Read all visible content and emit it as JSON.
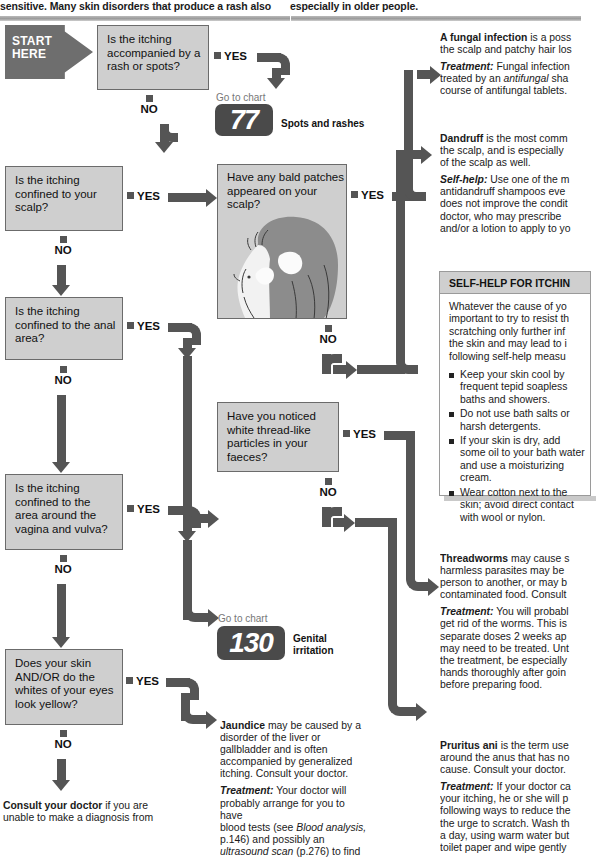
{
  "page": {
    "top_text_left": "sensitive. Many skin disorders that produce a rash also",
    "top_text_right": "especially in older people."
  },
  "start": {
    "line1": "START",
    "line2": "HERE"
  },
  "answers": {
    "yes": "YES",
    "no": "NO"
  },
  "questions": [
    {
      "id": "q-rash",
      "text": "Is the itching accompanied by a rash or spots?"
    },
    {
      "id": "q-scalp",
      "text": "Is the itching confined to your scalp?"
    },
    {
      "id": "q-anal",
      "text": "Is the itching confined to the anal area?"
    },
    {
      "id": "q-vagina",
      "text": "Is the itching confined to the area around the vagina and vulva?"
    },
    {
      "id": "q-yellow",
      "text": "Does your skin AND/OR do the whites of your eyes look yellow?"
    },
    {
      "id": "q-bald",
      "text": "Have any bald patches appeared on your scalp?"
    },
    {
      "id": "q-threadlike",
      "text": "Have you noticed white thread-like particles in your faeces?"
    }
  ],
  "goto": {
    "label": "Go to chart",
    "charts": [
      {
        "number": "77",
        "title": "Spots and rashes"
      },
      {
        "number": "130",
        "title": "Genital irritation"
      }
    ]
  },
  "advice": {
    "fungal": {
      "lead": "A fungal infection",
      "body": " is a poss",
      "line2": "the scalp and patchy hair los",
      "tx_label": "Treatment:",
      "tx_body": " Fungal infection",
      "tx_line2_a": "treated by an ",
      "tx_line2_i": "antifungal",
      "tx_line2_b": " sha",
      "tx_line3": "course of antifungal tablets."
    },
    "dandruff": {
      "lead": "Dandruff",
      "body": " is the most comm",
      "line2": "the scalp, and is especially",
      "line3": "of the scalp as well.",
      "sh_label": "Self-help:",
      "sh_body": " Use one of the m",
      "sh_line2": "antidandruff shampoos eve",
      "sh_line3": "does not improve the condit",
      "sh_line4": "doctor, who may prescribe",
      "sh_line5": "and/or a lotion to apply to yo"
    },
    "threadworms": {
      "lead": "Threadworms",
      "body": " may cause s",
      "line2": "harmless parasites may be",
      "line3": "person to another, or may b",
      "line4": "contaminated food. Consult",
      "tx_label": "Treatment:",
      "tx_body": " You will probabl",
      "tx_line2": "get rid of the worms. This is",
      "tx_line3": "separate doses 2 weeks ap",
      "tx_line4": "may need to be treated. Unt",
      "tx_line5": "the treatment, be especially",
      "tx_line6": "hands thoroughly after goin",
      "tx_line7": "before preparing food."
    },
    "jaundice": {
      "lead": "Jaundice",
      "body": " may be caused by a",
      "line2": "disorder of the liver or",
      "line3": "gallbladder and is often",
      "line4": "accompanied by generalized",
      "line5": "itching. Consult your doctor.",
      "tx_label": "Treatment:",
      "tx_body": " Your doctor will",
      "tx_line2": "probably arrange for you to have",
      "tx_line3_a": "blood tests (see ",
      "tx_line3_i": "Blood analysis,",
      "tx_line4": "p.146) and possibly an",
      "tx_line5_i": "ultrasound scan",
      "tx_line5_b": " (p.276) to find"
    },
    "pruritus": {
      "lead": "Pruritus ani",
      "body": " is the term use",
      "line2": "around the anus that has no",
      "line3": "cause. Consult your doctor.",
      "tx_label": "Treatment:",
      "tx_body": " If your doctor ca",
      "tx_line2": "your itching, he or she will p",
      "tx_line3": "following ways to reduce the",
      "tx_line4": "the urge to scratch. Wash th",
      "tx_line5": "a day, using warm water but",
      "tx_line6": "toilet paper and wipe gently"
    }
  },
  "selfhelp": {
    "heading": "SELF-HELP FOR ITCHIN",
    "intro_line1": "Whatever the cause of yo",
    "intro_line2": "important to try to resist th",
    "intro_line3": "scratching only further inf",
    "intro_line4": "the skin and may lead to i",
    "intro_line5": "following self-help measu",
    "bullets": [
      "Keep your skin cool by frequent tepid soapless baths and showers.",
      "Do not use bath salts or harsh detergents.",
      "If your skin is dry, add some oil to your bath water and use a moisturizing cream.",
      "Wear cotton next to the skin; avoid direct contact with wool or nylon."
    ]
  },
  "consult": {
    "lead": "Consult your doctor",
    "body": " if you are",
    "line2": "unable to make a diagnosis from"
  },
  "colors": {
    "connector": "#555555",
    "box_fill": "#cfcfcf",
    "box_border": "#6b6b6b",
    "badge": "#4a4a4a"
  }
}
